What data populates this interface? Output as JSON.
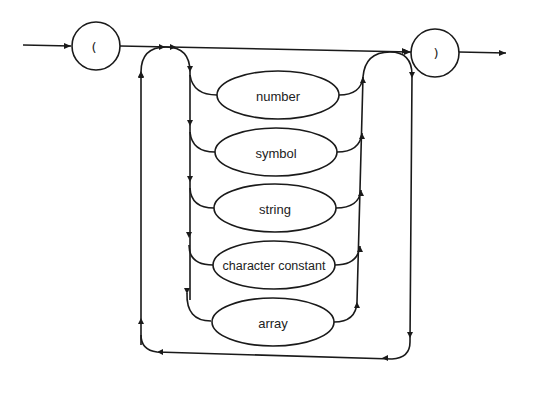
{
  "diagram": {
    "type": "syntax-diagram",
    "open_token": "(",
    "close_token": ")",
    "alternatives": [
      {
        "label": "number"
      },
      {
        "label": "symbol"
      },
      {
        "label": "string"
      },
      {
        "label": "character constant"
      },
      {
        "label": "array"
      }
    ],
    "colors": {
      "stroke": "#1a1a1a",
      "background": "#ffffff"
    }
  }
}
